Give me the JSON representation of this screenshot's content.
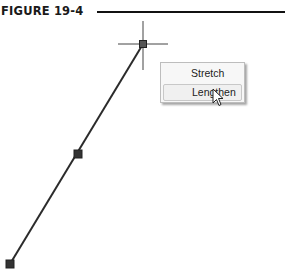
{
  "figure": {
    "title": "FIGURE 19-4"
  },
  "drawing": {
    "line": {
      "start": [
        143,
        44
      ],
      "end": [
        10,
        264
      ],
      "color": "#2b2b2b"
    },
    "grips": [
      {
        "name": "end-grip-top",
        "position": [
          143,
          44
        ]
      },
      {
        "name": "midpoint-grip",
        "position": [
          78,
          154
        ]
      },
      {
        "name": "end-grip-bottom",
        "position": [
          10,
          264
        ]
      }
    ],
    "crosshair": {
      "center": [
        143,
        44
      ]
    }
  },
  "context_menu": {
    "items": [
      {
        "label": "Stretch",
        "highlighted": false
      },
      {
        "label": "Lengthen",
        "highlighted": true
      }
    ]
  },
  "cursor": {
    "icon": "arrow-pointer-icon"
  }
}
